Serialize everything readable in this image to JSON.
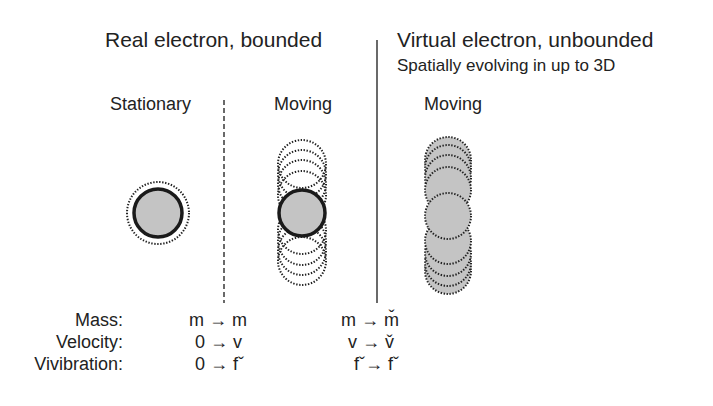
{
  "headings": {
    "real": "Real electron, bounded",
    "virtual": "Virtual electron, unbounded",
    "virtual_sub": "Spatially evolving in up to 3D"
  },
  "columns": {
    "stationary": "Stationary",
    "moving_real": "Moving",
    "moving_virtual": "Moving"
  },
  "properties": [
    {
      "label": "Mass:",
      "real": "m → m",
      "virtual": "m → m̌"
    },
    {
      "label": "Velocity:",
      "real": "0 → v",
      "virtual": "v → v̌"
    },
    {
      "label": "Vivibration:",
      "real": "0 → fˇ",
      "virtual": "fˇ→ fˇ"
    }
  ],
  "colors": {
    "fill": "#c4c4c4",
    "stroke": "#1a1a1a",
    "text": "#222222"
  }
}
